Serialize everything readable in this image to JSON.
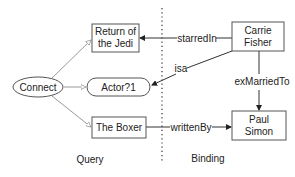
{
  "diagram": {
    "sections": {
      "query": "Query",
      "binding": "Binding"
    },
    "nodes": {
      "connect": "Connect",
      "return_of_the_jedi_line1": "Return of",
      "return_of_the_jedi_line2": "the Jedi",
      "actor": "Actor?1",
      "the_boxer": "The Boxer",
      "carrie_fisher_line1": "Carrie",
      "carrie_fisher_line2": "Fisher",
      "paul_simon_line1": "Paul",
      "paul_simon_line2": "Simon"
    },
    "edges": {
      "starred_in": "starredIn",
      "isa": "isa",
      "ex_married_to": "exMarriedTo",
      "written_by": "writtenBy"
    },
    "colors": {
      "query_edge": "#999999",
      "binding_edge": "#333333",
      "node_border": "#555555"
    }
  }
}
